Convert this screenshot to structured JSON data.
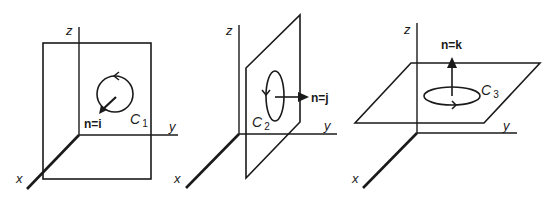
{
  "figure": {
    "colors": {
      "ink": "#1a1a1a",
      "background": "#ffffff"
    },
    "panels": [
      {
        "id": "panel-1",
        "plane": "yz-plane",
        "axes": {
          "x": "x",
          "y": "y",
          "z": "z"
        },
        "normal_label": "n=i",
        "curve_label": "C",
        "curve_subscript": "1"
      },
      {
        "id": "panel-2",
        "plane": "xz-plane",
        "axes": {
          "x": "x",
          "y": "y",
          "z": "z"
        },
        "normal_label": "n=j",
        "curve_label": "C",
        "curve_subscript": "2"
      },
      {
        "id": "panel-3",
        "plane": "xy-plane",
        "axes": {
          "x": "x",
          "y": "y",
          "z": "z"
        },
        "normal_label": "n=k",
        "curve_label": "C",
        "curve_subscript": "3"
      }
    ]
  }
}
